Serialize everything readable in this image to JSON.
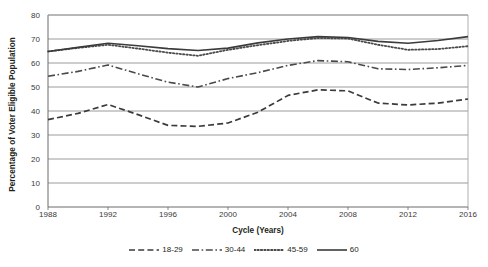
{
  "chart_data": {
    "type": "line",
    "title": "",
    "xlabel": "Cycle (Years)",
    "ylabel": "Percentage of Voter Eligible Population",
    "xlim": [
      1988,
      2016
    ],
    "ylim": [
      0,
      80
    ],
    "ytick_step": 10,
    "xtick_step": 4,
    "grid": "horizontal",
    "legend_position": "bottom",
    "x": [
      1988,
      1990,
      1992,
      1994,
      1996,
      1998,
      2000,
      2002,
      2004,
      2006,
      2008,
      2010,
      2012,
      2014,
      2016
    ],
    "xticks": [
      "1988",
      "1992",
      "1996",
      "2000",
      "2004",
      "2008",
      "2012",
      "2016"
    ],
    "yticks": [
      "0",
      "10",
      "20",
      "30",
      "40",
      "50",
      "60",
      "70",
      "80"
    ],
    "series": [
      {
        "name": "18-29",
        "style": "dashed",
        "color": "#3b3b3b",
        "values": [
          36.4,
          39.0,
          42.7,
          38.5,
          34.0,
          33.6,
          35.0,
          39.5,
          46.5,
          48.8,
          48.4,
          43.3,
          42.5,
          43.3,
          45.0
        ]
      },
      {
        "name": "30-44",
        "style": "dashdot",
        "color": "#4a4a4a",
        "values": [
          54.5,
          56.5,
          59.2,
          55.5,
          52.0,
          50.0,
          53.5,
          56.0,
          59.0,
          61.0,
          60.5,
          57.6,
          57.3,
          58.0,
          59.0
        ]
      },
      {
        "name": "45-59",
        "style": "dotted",
        "color": "#4a4a4a",
        "values": [
          64.8,
          66.3,
          67.6,
          66.0,
          64.3,
          63.0,
          65.5,
          67.4,
          69.2,
          70.4,
          70.2,
          67.6,
          65.5,
          65.8,
          67.0
        ]
      },
      {
        "name": "60",
        "style": "solid",
        "color": "#3b3b3b",
        "values": [
          64.8,
          66.5,
          68.2,
          67.2,
          66.0,
          65.2,
          66.2,
          68.4,
          70.0,
          71.0,
          70.6,
          69.0,
          68.2,
          69.4,
          71.0
        ]
      }
    ]
  },
  "legend": {
    "items": [
      {
        "label": "18-29",
        "style": "dashed"
      },
      {
        "label": "30-44",
        "style": "dashdot"
      },
      {
        "label": "45-59",
        "style": "dotted"
      },
      {
        "label": "60",
        "style": "solid"
      }
    ]
  }
}
